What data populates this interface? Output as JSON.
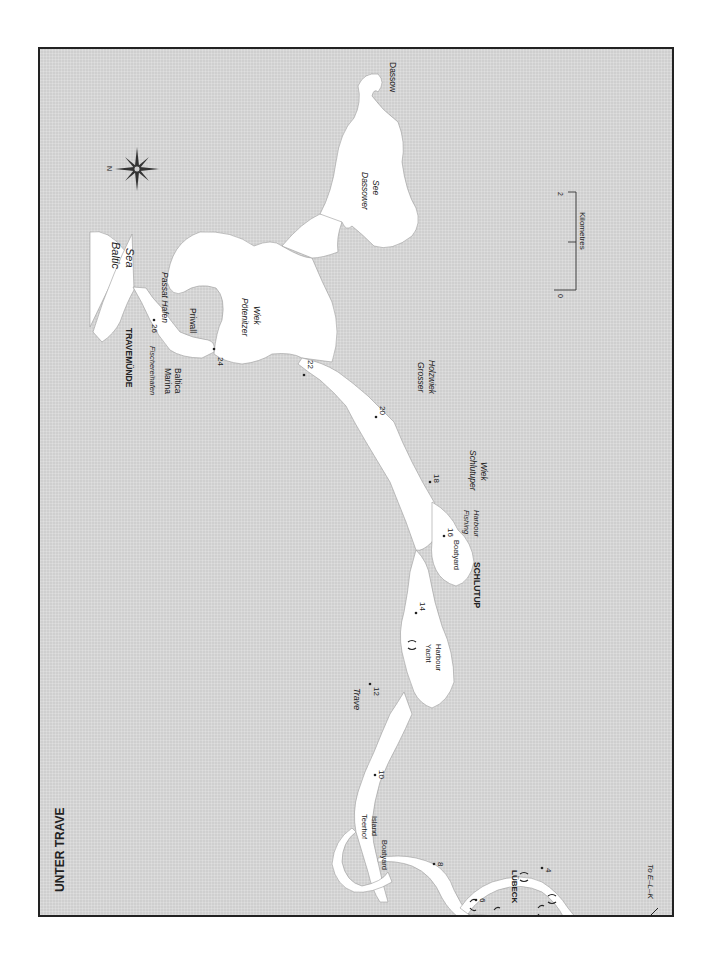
{
  "page": {
    "header_fragment": "",
    "map_title": "UNTER TRAVE"
  },
  "colors": {
    "land": "#cfcfcf",
    "water": "#ffffff",
    "frame": "#222222",
    "text": "#222222"
  },
  "places": {
    "dassow": "Dassow",
    "dassower_see_1": "Dassower",
    "dassower_see_2": "See",
    "baltic_1": "Baltic",
    "baltic_2": "Sea",
    "passat_hafen": "Passat Hafen",
    "priwall": "Priwall",
    "poetenitzer_1": "Pötenitzer",
    "poetenitzer_2": "Wiek",
    "travemuende": "TRAVEMÜNDE",
    "fischereihafen": "Fischereihafen",
    "marina_1": "Marina",
    "marina_2": "Baltica",
    "grosser_1": "Grosser",
    "grosser_2": "Holzwiek",
    "schlutuper_1": "Schlutuper",
    "schlutuper_2": "Wiek",
    "fishing_1": "Fishing",
    "fishing_2": "Harbour",
    "boatyard_schlutup": "Boatyard",
    "schlutup": "SCHLUTUP",
    "yacht_1": "Yacht",
    "yacht_2": "Harbour",
    "trave": "Trave",
    "teerhof_1": "Teerhof",
    "teerhof_2": "Island",
    "boatyard_teerhof": "Boatyard",
    "luebeck": "LÜBECK",
    "to_elk": "To E–L–K"
  },
  "km_markers": [
    "4",
    "6",
    "8",
    "10",
    "12",
    "14",
    "16",
    "18",
    "20",
    "22",
    "24",
    "26"
  ],
  "scale_bar": {
    "start": "0",
    "end": "2",
    "unit": "Kilometres"
  },
  "compass": {
    "north_label": "N",
    "icon": "compass-rose-icon"
  }
}
